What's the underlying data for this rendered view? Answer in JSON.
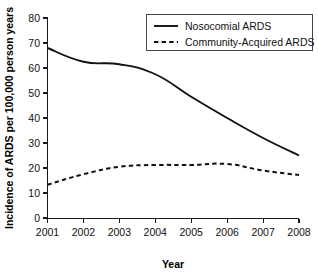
{
  "chart_data": {
    "type": "line",
    "title": "",
    "xlabel": "Year",
    "ylabel": "Incidence of ARDS per 100,000 person years",
    "x": [
      2001,
      2002,
      2003,
      2004,
      2005,
      2006,
      2007,
      2008
    ],
    "xticklabels": [
      "2001",
      "2002",
      "2003",
      "2004",
      "2005",
      "2006",
      "2007",
      "2008"
    ],
    "yticklabels": [
      "0",
      "10",
      "20",
      "30",
      "40",
      "50",
      "60",
      "70",
      "80"
    ],
    "yticks": [
      0,
      10,
      20,
      30,
      40,
      50,
      60,
      70,
      80
    ],
    "xlim": [
      2001,
      2008
    ],
    "ylim": [
      0,
      80
    ],
    "grid": false,
    "legend_position": "top-right",
    "series": [
      {
        "name": "Nosocomial ARDS",
        "style": "solid",
        "color": "#111111",
        "values": [
          68.0,
          62.5,
          61.5,
          57.5,
          48.5,
          40.0,
          32.0,
          25.0
        ]
      },
      {
        "name": "Community-Acquired ARDS",
        "style": "dashed",
        "color": "#111111",
        "values": [
          13.3,
          17.5,
          20.5,
          21.2,
          21.2,
          21.6,
          19.0,
          17.2
        ]
      }
    ]
  }
}
